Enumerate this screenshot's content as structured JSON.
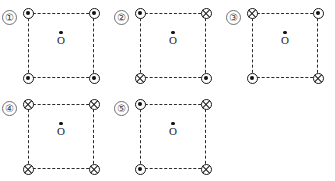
{
  "figure": {
    "background_color": "#ffffff",
    "line_color": "#2b2b2b",
    "marker_color": "#1a1a1a",
    "center_label": "O",
    "marker_legend": {
      "out": "current out of page (dot)",
      "in": "current into page (cross)"
    },
    "panels": [
      {
        "index": "1",
        "label": "①",
        "corners": {
          "top_left": "out",
          "top_right": "out",
          "bottom_left": "out",
          "bottom_right": "out"
        },
        "center_label": "O"
      },
      {
        "index": "2",
        "label": "②",
        "corners": {
          "top_left": "out",
          "top_right": "in",
          "bottom_left": "in",
          "bottom_right": "out"
        },
        "center_label": "O"
      },
      {
        "index": "3",
        "label": "③",
        "corners": {
          "top_left": "in",
          "top_right": "out",
          "bottom_left": "out",
          "bottom_right": "in"
        },
        "center_label": "O"
      },
      {
        "index": "4",
        "label": "④",
        "corners": {
          "top_left": "in",
          "top_right": "in",
          "bottom_left": "in",
          "bottom_right": "in"
        },
        "center_label": "O"
      },
      {
        "index": "5",
        "label": "⑤",
        "corners": {
          "top_left": "out",
          "top_right": "in",
          "bottom_left": "out",
          "bottom_right": "in"
        },
        "center_label": "O"
      }
    ]
  }
}
